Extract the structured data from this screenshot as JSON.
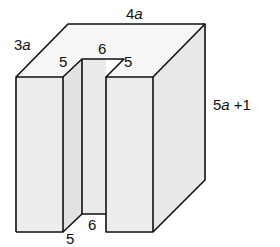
{
  "diagram": {
    "type": "3d-solid-with-slot",
    "labels": {
      "top_length": {
        "coef": "4",
        "var": "a",
        "suffix": ""
      },
      "depth": {
        "coef": "3",
        "var": "a",
        "suffix": ""
      },
      "height": {
        "coef": "5",
        "var": "a",
        "suffix": " +1"
      },
      "slot_top_depth_left": "5",
      "slot_top_width": "6",
      "slot_top_depth_right": "5",
      "slot_bottom_depth": "5",
      "slot_bottom_width": "6"
    },
    "colors": {
      "front_face": "#ececec",
      "top_face": "#f7f7f7",
      "side_face": "#e6e6e6",
      "slot_inner": "#e0e0e0",
      "edge": "#111111"
    }
  }
}
